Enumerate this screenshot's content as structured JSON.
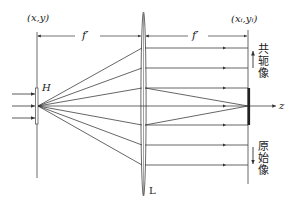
{
  "diagram": {
    "title": "",
    "labels": {
      "object_plane": "(x,y)",
      "image_plane": "(xᵢ,yᵢ)",
      "focal_left": "f′",
      "focal_right": "f′",
      "hologram": "H",
      "lens": "L",
      "axis": "z",
      "conjugate_image": "共轭像",
      "original_image": "原始像"
    },
    "colors": {
      "line": "#333333",
      "background": "#ffffff"
    },
    "geometry": {
      "hologram_x": 37,
      "source_point": [
        38,
        106
      ],
      "lens_x": 143,
      "image_plane_x": 248,
      "ray_heights_at_lens": [
        48,
        68,
        88,
        106,
        125,
        145,
        165
      ],
      "axis_y": 106
    }
  }
}
